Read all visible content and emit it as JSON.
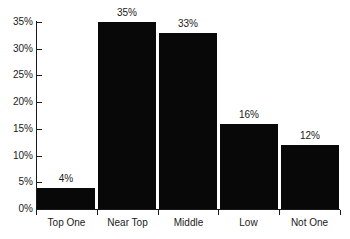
{
  "chart_data": {
    "type": "bar",
    "title": "",
    "subtitle": "",
    "xlabel": "",
    "ylabel": "",
    "categories": [
      "Top One",
      "Near Top",
      "Middle",
      "Low",
      "Not One"
    ],
    "values": [
      4,
      35,
      33,
      16,
      12
    ],
    "value_labels": [
      "4%",
      "35%",
      "33%",
      "16%",
      "12%"
    ],
    "ylim": [
      0,
      35
    ],
    "y_ticks": [
      0,
      5,
      10,
      15,
      20,
      25,
      30,
      35
    ],
    "y_tick_labels": [
      "0%",
      "5%",
      "10%",
      "15%",
      "20%",
      "25%",
      "30%",
      "35%"
    ],
    "grid": false,
    "legend": null,
    "bar_color": "#080808",
    "axis_color": "#1a1a1a",
    "background_color": "#ffffff"
  }
}
